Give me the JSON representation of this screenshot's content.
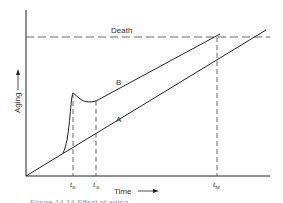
{
  "diagram": {
    "death_label": "Death",
    "y_axis_label": "Aging",
    "x_axis_label": "Time",
    "curve_labels": {
      "a": "A",
      "b": "B"
    },
    "ticks": {
      "tb": {
        "main": "t",
        "sub": "B"
      },
      "tb_prime": {
        "main": "t",
        "sub": "B",
        "prime": "′"
      },
      "tm": {
        "main": "t",
        "sub": "M"
      }
    },
    "caption": "Figure 14.14  Effect of aging ... (caption cut off)"
  },
  "colors": {
    "line": "#222222",
    "background": "#ffffff"
  }
}
